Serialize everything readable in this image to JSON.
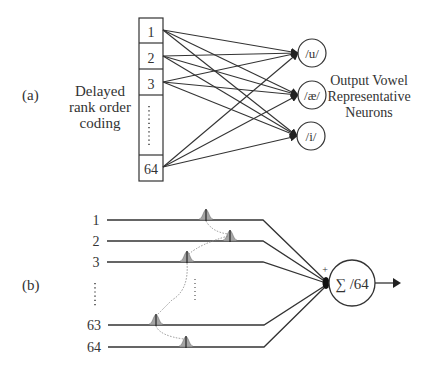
{
  "panel_a": {
    "label": "(a)",
    "input_caption": [
      "Delayed",
      "rank order",
      "coding"
    ],
    "input_cells": [
      "1",
      "2",
      "3",
      "64"
    ],
    "output_neurons": [
      "/u/",
      "/æ/",
      "/i/"
    ],
    "output_caption": [
      "Output Vowel",
      "Representative",
      "Neurons"
    ]
  },
  "panel_b": {
    "label": "(b)",
    "input_lines": [
      "1",
      "2",
      "3",
      "63",
      "64"
    ],
    "sum_label": "∑ /64",
    "plus_sign": "+"
  },
  "colors": {
    "line": "#333333",
    "spike_fill": "#9a9a9a",
    "dotted": "#888888"
  }
}
